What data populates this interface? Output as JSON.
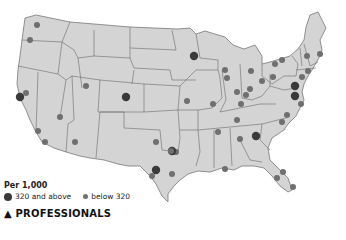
{
  "map": {
    "region": "Contiguous United States",
    "land_color": "#d4d4d4",
    "border_color": "#666666",
    "colors": {
      "high": "#3a3a3a",
      "low": "#6f6f6f"
    }
  },
  "legend": {
    "title": "Per 1,000",
    "items": [
      {
        "label": "320 and above",
        "size": "large",
        "color": "#3a3a3a"
      },
      {
        "label": "below 320",
        "size": "small",
        "color": "#6f6f6f"
      }
    ]
  },
  "footer": {
    "marker": "▲",
    "title": "PROFESSIONALS"
  },
  "points": [
    {
      "x": 37,
      "y": 25,
      "cat": "low"
    },
    {
      "x": 30,
      "y": 40,
      "cat": "low"
    },
    {
      "x": 20,
      "y": 97,
      "cat": "high"
    },
    {
      "x": 26,
      "y": 93,
      "cat": "low"
    },
    {
      "x": 60,
      "y": 117,
      "cat": "low"
    },
    {
      "x": 38,
      "y": 131,
      "cat": "low"
    },
    {
      "x": 45,
      "y": 142,
      "cat": "low"
    },
    {
      "x": 75,
      "y": 142,
      "cat": "low"
    },
    {
      "x": 86,
      "y": 86,
      "cat": "low"
    },
    {
      "x": 126,
      "y": 97,
      "cat": "high"
    },
    {
      "x": 194,
      "y": 56,
      "cat": "high"
    },
    {
      "x": 225,
      "y": 70,
      "cat": "low"
    },
    {
      "x": 227,
      "y": 78,
      "cat": "low"
    },
    {
      "x": 251,
      "y": 71,
      "cat": "low"
    },
    {
      "x": 262,
      "y": 81,
      "cat": "low"
    },
    {
      "x": 237,
      "y": 92,
      "cat": "low"
    },
    {
      "x": 250,
      "y": 89,
      "cat": "low"
    },
    {
      "x": 246,
      "y": 95,
      "cat": "low"
    },
    {
      "x": 273,
      "y": 77,
      "cat": "low"
    },
    {
      "x": 275,
      "y": 64,
      "cat": "low"
    },
    {
      "x": 282,
      "y": 60,
      "cat": "low"
    },
    {
      "x": 307,
      "y": 56,
      "cat": "low"
    },
    {
      "x": 320,
      "y": 54,
      "cat": "low"
    },
    {
      "x": 308,
      "y": 71,
      "cat": "low"
    },
    {
      "x": 302,
      "y": 77,
      "cat": "low"
    },
    {
      "x": 295,
      "y": 86,
      "cat": "high"
    },
    {
      "x": 295,
      "y": 96,
      "cat": "high"
    },
    {
      "x": 301,
      "y": 104,
      "cat": "low"
    },
    {
      "x": 187,
      "y": 101,
      "cat": "low"
    },
    {
      "x": 213,
      "y": 104,
      "cat": "low"
    },
    {
      "x": 241,
      "y": 104,
      "cat": "low"
    },
    {
      "x": 287,
      "y": 115,
      "cat": "low"
    },
    {
      "x": 282,
      "y": 122,
      "cat": "low"
    },
    {
      "x": 237,
      "y": 120,
      "cat": "low"
    },
    {
      "x": 218,
      "y": 132,
      "cat": "low"
    },
    {
      "x": 256,
      "y": 136,
      "cat": "high"
    },
    {
      "x": 240,
      "y": 139,
      "cat": "low"
    },
    {
      "x": 173,
      "y": 152,
      "cat": "low"
    },
    {
      "x": 176,
      "y": 152,
      "cat": "low"
    },
    {
      "x": 156,
      "y": 142,
      "cat": "low"
    },
    {
      "x": 175,
      "y": 152,
      "cat": "low"
    },
    {
      "x": 172,
      "y": 151,
      "cat": "high"
    },
    {
      "x": 171,
      "y": 151,
      "cat": "low"
    },
    {
      "x": 156,
      "y": 170,
      "cat": "high"
    },
    {
      "x": 152,
      "y": 176,
      "cat": "low"
    },
    {
      "x": 172,
      "y": 174,
      "cat": "low"
    },
    {
      "x": 225,
      "y": 169,
      "cat": "low"
    },
    {
      "x": 283,
      "y": 172,
      "cat": "low"
    },
    {
      "x": 277,
      "y": 178,
      "cat": "low"
    },
    {
      "x": 293,
      "y": 187,
      "cat": "low"
    }
  ]
}
